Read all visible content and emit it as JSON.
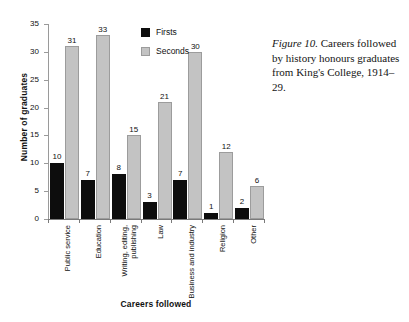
{
  "caption": {
    "figure_label": "Figure 10.",
    "text": "Careers followed by history honours graduates from King's College, 1914–29."
  },
  "legend": {
    "items": [
      {
        "label": "Firsts",
        "color": "#0d0d0d",
        "swatch": "firsts-swatch"
      },
      {
        "label": "Seconds",
        "color": "#c3c3c3",
        "swatch": "seconds-swatch"
      }
    ]
  },
  "axes": {
    "ylabel": "Number of graduates",
    "xlabel": "Careers followed",
    "yticks": [
      "0",
      "5",
      "10",
      "15",
      "20",
      "25",
      "30",
      "35"
    ]
  },
  "chart_data": {
    "type": "bar",
    "title": "",
    "xlabel": "Careers followed",
    "ylabel": "Number of graduates",
    "ylim": [
      0,
      35
    ],
    "ytick_step": 5,
    "grid": false,
    "legend_position": "inside-top-center",
    "categories": [
      "Public service",
      "Education",
      "Writing, editing, publishing",
      "Law",
      "Business and industry",
      "Religion",
      "Other"
    ],
    "category_lines": [
      [
        "Public service"
      ],
      [
        "Education"
      ],
      [
        "Writing, editing,",
        "publishing"
      ],
      [
        "Law"
      ],
      [
        "Business and industry"
      ],
      [
        "Religion"
      ],
      [
        "Other"
      ]
    ],
    "series": [
      {
        "name": "Firsts",
        "color": "#0d0d0d",
        "values": [
          10,
          7,
          8,
          3,
          7,
          1,
          2
        ]
      },
      {
        "name": "Seconds",
        "color": "#c3c3c3",
        "values": [
          31,
          33,
          15,
          21,
          30,
          12,
          6
        ]
      }
    ]
  }
}
